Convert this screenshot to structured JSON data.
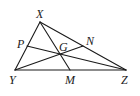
{
  "diagram": {
    "type": "triangle-medians-centroid",
    "stroke_color": "#1a1a1a",
    "background": "#ffffff",
    "vertices": {
      "X": {
        "label": "X",
        "x": 40,
        "y": 22
      },
      "Y": {
        "label": "Y",
        "x": 15,
        "y": 70
      },
      "Z": {
        "label": "Z",
        "x": 126,
        "y": 70
      }
    },
    "midpoints": {
      "M": {
        "label": "M",
        "x": 70,
        "y": 70,
        "on": "YZ"
      },
      "N": {
        "label": "N",
        "x": 83,
        "y": 46,
        "on": "XZ"
      },
      "P": {
        "label": "P",
        "x": 27,
        "y": 46,
        "on": "XY"
      }
    },
    "centroid": {
      "label": "G",
      "x": 60,
      "y": 54
    },
    "medians": [
      "XM",
      "YN",
      "ZP"
    ],
    "labels": {
      "X": "X",
      "Y": "Y",
      "Z": "Z",
      "M": "M",
      "N": "N",
      "P": "P",
      "G": "G"
    }
  }
}
